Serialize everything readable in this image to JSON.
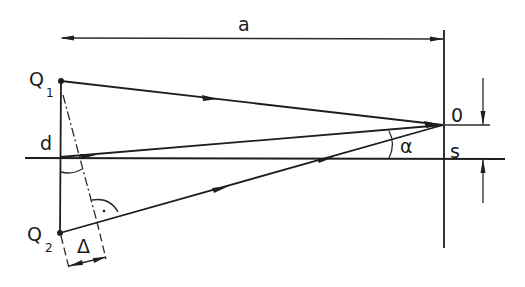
{
  "diagram": {
    "title": "",
    "labels": {
      "distance": "a",
      "source1": "Q",
      "source1_sub": "1",
      "source2": "Q",
      "source2_sub": "2",
      "separation": "d",
      "observer": "0",
      "offset": "s",
      "angle": "α",
      "path_difference": "Δ"
    },
    "points": {
      "Q1": [
        61,
        81
      ],
      "Q2": [
        60,
        233
      ],
      "axis_origin": [
        60,
        158
      ],
      "O": [
        443,
        125
      ]
    },
    "colors": {
      "ink": "#1e1e1e",
      "background": "#ffffff"
    }
  }
}
